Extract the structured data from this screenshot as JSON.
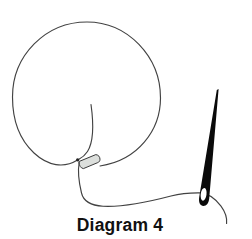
{
  "figure": {
    "caption": "Diagram 4",
    "parts": {
      "loop": "large circular loop of thread",
      "inner_thread": "thread end inside loop",
      "anchor_dot": "small dot at loop base",
      "fold": "folded thread wrap at loop base",
      "working_thread": "thread running from loop base to needle",
      "needle": "sewing needle with eye, angled at right"
    }
  },
  "colors": {
    "background": "#ffffff",
    "line": "#424242",
    "needle": "#0a0a0a",
    "needle_eye_hole": "#ffffff",
    "fold_fill": "#dcdfdc",
    "dot": "#222222",
    "caption_text": "#111111"
  }
}
